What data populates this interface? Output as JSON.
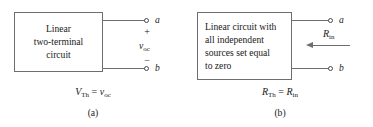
{
  "figure": {
    "panels": [
      {
        "id": "a",
        "caption": "(a)",
        "box_lines": [
          "Linear",
          "two-terminal",
          "circuit"
        ],
        "equation": {
          "lhs_symbol": "V",
          "lhs_sub": "Th",
          "operator": "=",
          "rhs_symbol": "v",
          "rhs_sub": "oc"
        },
        "terminals": [
          {
            "name": "a",
            "label": "a"
          },
          {
            "name": "b",
            "label": "b"
          }
        ],
        "polarity_plus": "+",
        "polarity_minus": "−",
        "voltage_symbol": "v",
        "voltage_sub": "oc"
      },
      {
        "id": "b",
        "caption": "(b)",
        "box_lines": [
          "Linear circuit with",
          "all independent",
          "sources set equal",
          "to zero"
        ],
        "equation": {
          "lhs_symbol": "R",
          "lhs_sub": "Th",
          "operator": "=",
          "rhs_symbol": "R",
          "rhs_sub": "in"
        },
        "terminals": [
          {
            "name": "a",
            "label": "a"
          },
          {
            "name": "b",
            "label": "b"
          }
        ],
        "resistance_symbol": "R",
        "resistance_sub": "in"
      }
    ],
    "colors": {
      "line": "#6e6e70",
      "text": "#1a1a1a",
      "background": "#ffffff"
    }
  }
}
